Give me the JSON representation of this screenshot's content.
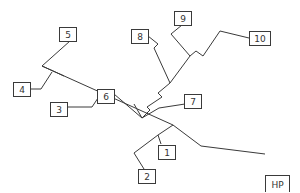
{
  "diagram": {
    "type": "phylogenetic-tree",
    "colors": {
      "line": "#3a3a3a",
      "box_fill": "#ffffff",
      "text": "#333333"
    },
    "nodes": [
      {
        "id": "n1",
        "label": "1",
        "x": 158,
        "y": 145,
        "w": 17,
        "h": 14
      },
      {
        "id": "n2",
        "label": "2",
        "x": 138,
        "y": 169,
        "w": 17,
        "h": 14
      },
      {
        "id": "n3",
        "label": "3",
        "x": 50,
        "y": 102,
        "w": 17,
        "h": 14
      },
      {
        "id": "n4",
        "label": "4",
        "x": 13,
        "y": 82,
        "w": 17,
        "h": 14
      },
      {
        "id": "n5",
        "label": "5",
        "x": 59,
        "y": 27,
        "w": 17,
        "h": 14
      },
      {
        "id": "n6",
        "label": "6",
        "x": 97,
        "y": 89,
        "w": 17,
        "h": 14
      },
      {
        "id": "n7",
        "label": "7",
        "x": 184,
        "y": 94,
        "w": 17,
        "h": 14
      },
      {
        "id": "n8",
        "label": "8",
        "x": 131,
        "y": 29,
        "w": 17,
        "h": 14
      },
      {
        "id": "n9",
        "label": "9",
        "x": 174,
        "y": 11,
        "w": 17,
        "h": 14
      },
      {
        "id": "n10",
        "label": "10",
        "x": 249,
        "y": 31,
        "w": 21,
        "h": 14
      },
      {
        "id": "hp",
        "label": "HP",
        "x": 265,
        "y": 175,
        "w": 24,
        "h": 18
      }
    ],
    "edges": [
      {
        "from": "n5",
        "points": "70,41 42,66 64,76"
      },
      {
        "from": "n4",
        "points": "30,89 41,89 52,72"
      },
      {
        "from": "backbone",
        "points": "42,66 173,125 201,146 265,154"
      },
      {
        "from": "n3",
        "points": "67,107 92,107 102,92"
      },
      {
        "from": "n6",
        "points": "114,94 142,118 159,108 185,104"
      },
      {
        "from": "clade-6",
        "points": "134,104 142,118"
      },
      {
        "from": "hp-clade",
        "points": "173,125 158,135"
      },
      {
        "from": "n1",
        "points": "158,135 161,144"
      },
      {
        "from": "n2",
        "points": "158,135 134,153 144,169"
      },
      {
        "from": "upper-clade",
        "points": "142,118 150,110 147,107 162,97 158,93 170,83"
      },
      {
        "from": "n8",
        "points": "148,36 158,44 154,48 170,83"
      },
      {
        "from": "n8-9-10",
        "points": "170,83 190,56"
      },
      {
        "from": "n9",
        "points": "182,25 171,34 190,56"
      },
      {
        "from": "n10",
        "points": "190,56 196,51 203,56 220,31 249,38"
      }
    ]
  }
}
